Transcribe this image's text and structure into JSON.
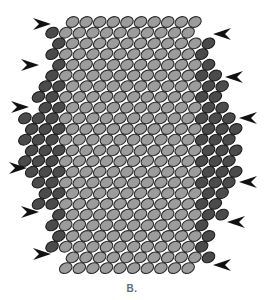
{
  "figure": {
    "caption": "B.",
    "colors": {
      "background": "#ffffff",
      "light_cell_fill": "#9c9c9c",
      "light_cell_stroke": "#2e2e2e",
      "dark_cell_fill": "#4b4b4b",
      "dark_cell_stroke": "#1e1e1e",
      "arrow": "#111111"
    },
    "cell": {
      "rx": 6.6,
      "ry": 5.0,
      "rotate_deg": -28,
      "pitch_x": 13.6,
      "pitch_y": 10.7,
      "first_row_y": 22
    },
    "core": {
      "x_start": 72.5,
      "count": 10
    },
    "rows_dark_per_side": [
      {
        "left": 0,
        "right": 0
      },
      {
        "left": 1,
        "right": 0
      },
      {
        "left": 1,
        "right": 1
      },
      {
        "left": 1,
        "right": 1
      },
      {
        "left": 1,
        "right": 1
      },
      {
        "left": 1,
        "right": 2
      },
      {
        "left": 2,
        "right": 2
      },
      {
        "left": 2,
        "right": 2
      },
      {
        "left": 2,
        "right": 2
      },
      {
        "left": 3,
        "right": 3
      },
      {
        "left": 3,
        "right": 3
      },
      {
        "left": 3,
        "right": 3
      },
      {
        "left": 3,
        "right": 3
      },
      {
        "left": 3,
        "right": 3
      },
      {
        "left": 3,
        "right": 3
      },
      {
        "left": 2,
        "right": 3
      },
      {
        "left": 2,
        "right": 2
      },
      {
        "left": 2,
        "right": 2
      },
      {
        "left": 1,
        "right": 2
      },
      {
        "left": 1,
        "right": 1
      },
      {
        "left": 1,
        "right": 1
      },
      {
        "left": 1,
        "right": 1
      },
      {
        "left": 0,
        "right": 1
      },
      {
        "left": 0,
        "right": 0
      }
    ],
    "arrows_left": [
      {
        "x": 42,
        "y": 24
      },
      {
        "x": 30,
        "y": 65
      },
      {
        "x": 20,
        "y": 107
      },
      {
        "x": 18,
        "y": 168
      },
      {
        "x": 30,
        "y": 212
      },
      {
        "x": 42,
        "y": 254
      }
    ],
    "arrows_right": [
      {
        "x": 222,
        "y": 34
      },
      {
        "x": 234,
        "y": 77
      },
      {
        "x": 248,
        "y": 118
      },
      {
        "x": 248,
        "y": 182
      },
      {
        "x": 236,
        "y": 222
      },
      {
        "x": 222,
        "y": 265
      }
    ]
  }
}
